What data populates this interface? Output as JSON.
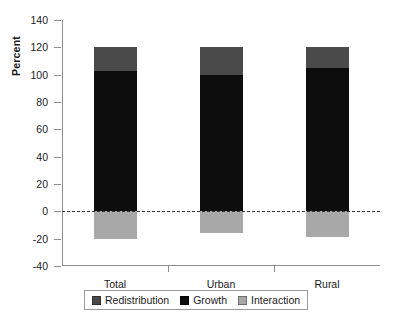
{
  "chart_data": {
    "type": "bar",
    "title": "",
    "subtitle": "",
    "xlabel": "",
    "ylabel": "Percent",
    "categories": [
      "Total",
      "Urban",
      "Rural"
    ],
    "ylim": [
      -40,
      140
    ],
    "yticks": [
      140,
      120,
      100,
      80,
      60,
      40,
      20,
      0,
      -20,
      -40
    ],
    "ytick_labels": [
      "140",
      "120",
      "100",
      "80",
      "60",
      "40",
      "20",
      "0",
      "-20",
      "-40"
    ],
    "grid": false,
    "stacked": true,
    "zero_reference_line": 0,
    "legend_position": "bottom",
    "series": [
      {
        "name": "Redistribution",
        "color": "#4a4a4a",
        "values": [
          17,
          20,
          15
        ]
      },
      {
        "name": "Growth",
        "color": "#0d0d0d",
        "values": [
          103,
          100,
          105
        ]
      },
      {
        "name": "Interaction",
        "color": "#a8a8a8",
        "values": [
          -20,
          -16,
          -19
        ]
      }
    ],
    "bar_tops": [
      120,
      120,
      120
    ]
  },
  "legend": {
    "items": [
      {
        "label": "Redistribution",
        "color": "#4a4a4a"
      },
      {
        "label": "Growth",
        "color": "#0d0d0d"
      },
      {
        "label": "Interaction",
        "color": "#a8a8a8"
      }
    ]
  }
}
